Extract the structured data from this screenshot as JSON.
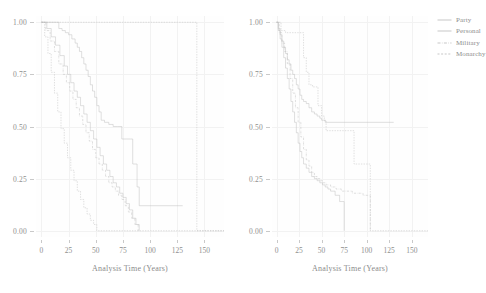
{
  "figure": {
    "type": "two-panel-survival-plot",
    "width": 475,
    "height": 293,
    "background": "#ffffff",
    "line_color": "#b9b9b9",
    "grid_color": "#f2f2f2",
    "text_color": "#8f8f8f"
  },
  "legend": {
    "position": "right",
    "entries": [
      {
        "label": "Party",
        "dash": "solid",
        "pattern": "none"
      },
      {
        "label": "Personal",
        "dash": "solid",
        "pattern": "none"
      },
      {
        "label": "Military",
        "dash": "dashdot",
        "pattern": "5 2 1 2"
      },
      {
        "label": "Monarchy",
        "dash": "dashed",
        "pattern": "3 2"
      }
    ]
  },
  "axes": {
    "xlabel": "Analysis Time (Years)",
    "ylabel": "",
    "xticks": [
      0,
      25,
      50,
      75,
      100,
      125,
      150
    ],
    "xticklabels": [
      "0",
      "25",
      "50",
      "75",
      "100",
      "125",
      "150"
    ],
    "yticks": [
      0.0,
      0.25,
      0.5,
      0.75,
      1.0
    ],
    "yticklabels": [
      "0.00",
      "0.25",
      "0.50",
      "0.75",
      "1.00"
    ],
    "xlim": [
      -5,
      168
    ],
    "ylim": [
      -0.03,
      1.03
    ],
    "grid": true
  },
  "chart_data": [
    {
      "type": "line",
      "panel": "left",
      "title": "",
      "xlabel": "Analysis Time (Years)",
      "ylabel": "",
      "xlim": [
        -5,
        168
      ],
      "ylim": [
        -0.03,
        1.03
      ],
      "grid": true,
      "step": "post",
      "series": [
        {
          "name": "Party",
          "dash": "solid",
          "x": [
            0,
            13,
            16,
            19,
            22,
            25,
            28,
            31,
            33,
            35,
            37,
            39,
            41,
            43,
            45,
            47,
            49,
            51,
            53,
            55,
            58,
            62,
            66,
            70,
            74,
            78,
            82,
            84,
            86,
            88,
            90,
            130
          ],
          "y": [
            1.0,
            1.0,
            0.97,
            0.96,
            0.95,
            0.94,
            0.92,
            0.9,
            0.88,
            0.86,
            0.83,
            0.8,
            0.77,
            0.74,
            0.7,
            0.67,
            0.64,
            0.6,
            0.57,
            0.53,
            0.52,
            0.51,
            0.5,
            0.5,
            0.44,
            0.44,
            0.44,
            0.32,
            0.32,
            0.21,
            0.12,
            0.12
          ]
        },
        {
          "name": "Personal",
          "dash": "solid",
          "x": [
            0,
            5,
            9,
            13,
            17,
            21,
            24,
            27,
            30,
            33,
            36,
            39,
            42,
            45,
            48,
            51,
            54,
            57,
            60,
            63,
            66,
            69,
            72,
            75,
            78,
            81,
            84,
            87,
            90
          ],
          "y": [
            1.0,
            0.97,
            0.93,
            0.89,
            0.84,
            0.79,
            0.75,
            0.71,
            0.67,
            0.64,
            0.6,
            0.56,
            0.52,
            0.48,
            0.44,
            0.4,
            0.36,
            0.32,
            0.29,
            0.26,
            0.23,
            0.21,
            0.18,
            0.16,
            0.13,
            0.1,
            0.06,
            0.03,
            0.0
          ]
        },
        {
          "name": "Military",
          "dash": "dashdot",
          "x": [
            0,
            4,
            8,
            12,
            16,
            20,
            23,
            26,
            29,
            32,
            35,
            38,
            41,
            44,
            47,
            50,
            53,
            56,
            59,
            62,
            65,
            68,
            71,
            74,
            77,
            80,
            83,
            86,
            89
          ],
          "y": [
            1.0,
            0.96,
            0.91,
            0.86,
            0.8,
            0.75,
            0.71,
            0.67,
            0.63,
            0.59,
            0.55,
            0.51,
            0.47,
            0.43,
            0.39,
            0.35,
            0.32,
            0.29,
            0.26,
            0.23,
            0.21,
            0.19,
            0.17,
            0.15,
            0.12,
            0.09,
            0.06,
            0.03,
            0.0
          ]
        },
        {
          "name": "Monarchy",
          "dash": "dashed",
          "x": [
            0,
            3,
            6,
            9,
            12,
            15,
            18,
            21,
            24,
            27,
            30,
            33,
            36,
            39,
            42,
            45,
            48,
            51,
            143,
            143,
            168
          ],
          "y": [
            1.0,
            0.93,
            0.85,
            0.76,
            0.66,
            0.57,
            0.49,
            0.42,
            0.35,
            0.29,
            0.24,
            0.19,
            0.15,
            0.11,
            0.08,
            0.05,
            0.03,
            0.0,
            0.0,
            0.0,
            0.0
          ]
        },
        {
          "name": "Monarchy-top",
          "dash": "dashed",
          "x": [
            0,
            143,
            143,
            168
          ],
          "y": [
            1.0,
            1.0,
            0.0,
            0.0
          ]
        }
      ]
    },
    {
      "type": "line",
      "panel": "right",
      "title": "",
      "xlabel": "Analysis Time (Years)",
      "ylabel": "",
      "xlim": [
        -5,
        168
      ],
      "ylim": [
        -0.03,
        1.03
      ],
      "grid": true,
      "step": "post",
      "series": [
        {
          "name": "Party",
          "dash": "solid",
          "x": [
            0,
            2,
            4,
            6,
            8,
            10,
            12,
            14,
            16,
            18,
            20,
            22,
            24,
            26,
            28,
            30,
            33,
            36,
            39,
            42,
            45,
            48,
            50,
            52,
            54,
            130
          ],
          "y": [
            1.0,
            0.97,
            0.94,
            0.91,
            0.88,
            0.85,
            0.82,
            0.8,
            0.77,
            0.75,
            0.73,
            0.7,
            0.68,
            0.65,
            0.63,
            0.62,
            0.61,
            0.59,
            0.57,
            0.56,
            0.55,
            0.54,
            0.53,
            0.53,
            0.52,
            0.52
          ]
        },
        {
          "name": "Personal",
          "dash": "solid",
          "x": [
            0,
            2,
            4,
            6,
            8,
            10,
            12,
            14,
            16,
            18,
            20,
            22,
            24,
            26,
            28,
            30,
            33,
            36,
            39,
            42,
            45,
            48,
            51,
            54,
            57,
            60,
            65,
            70,
            75
          ],
          "y": [
            1.0,
            0.96,
            0.92,
            0.88,
            0.83,
            0.78,
            0.73,
            0.68,
            0.62,
            0.57,
            0.52,
            0.47,
            0.42,
            0.38,
            0.35,
            0.32,
            0.3,
            0.28,
            0.26,
            0.25,
            0.24,
            0.23,
            0.22,
            0.21,
            0.2,
            0.19,
            0.17,
            0.14,
            0.0
          ]
        },
        {
          "name": "Military",
          "dash": "dashdot",
          "x": [
            0,
            3,
            6,
            9,
            12,
            15,
            18,
            21,
            24,
            27,
            30,
            33,
            36,
            39,
            42,
            45,
            48,
            51,
            55,
            60,
            66,
            72,
            78,
            84,
            90,
            96,
            102,
            104
          ],
          "y": [
            1.0,
            0.95,
            0.9,
            0.86,
            0.8,
            0.73,
            0.66,
            0.59,
            0.52,
            0.45,
            0.39,
            0.34,
            0.31,
            0.28,
            0.26,
            0.25,
            0.24,
            0.23,
            0.22,
            0.21,
            0.2,
            0.19,
            0.19,
            0.18,
            0.18,
            0.17,
            0.17,
            0.0
          ]
        },
        {
          "name": "Monarchy",
          "dash": "dashed",
          "x": [
            0,
            5,
            10,
            14,
            16,
            30,
            33,
            36,
            40,
            43,
            46,
            50,
            53,
            55,
            80,
            83,
            86,
            103,
            104,
            168
          ],
          "y": [
            1.0,
            0.96,
            0.95,
            0.95,
            0.95,
            0.83,
            0.76,
            0.7,
            0.69,
            0.69,
            0.6,
            0.55,
            0.53,
            0.48,
            0.48,
            0.48,
            0.32,
            0.32,
            0.0,
            0.0
          ]
        }
      ]
    }
  ]
}
